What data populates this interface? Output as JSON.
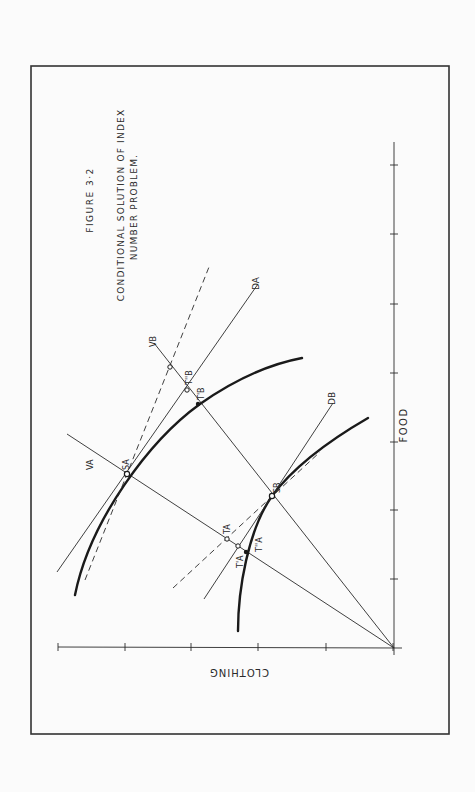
{
  "figure": {
    "number_label": "FIGURE 3·2",
    "title_line1": "CONDITIONAL SOLUTION OF INDEX",
    "title_line2": "NUMBER PROBLEM.",
    "orientation": "rotated 90° counter-clockwise"
  },
  "axes": {
    "x_label": "CLOTHING",
    "y_label": "FOOD",
    "clothing_ticks": 5,
    "food_ticks": 7
  },
  "labels": {
    "VA": "VA",
    "VB": "VB",
    "DA": "DA",
    "DB": "DB",
    "SA": "SA",
    "SB": "SB",
    "TA": "TA",
    "TA_prime": "T'A",
    "TA_dprime": "T''A",
    "TB": "TB",
    "TB_prime": "T'B",
    "TB_dprime": "T''B"
  },
  "colors": {
    "ink": "#1a1a1a",
    "paper": "#fbfbfb"
  }
}
